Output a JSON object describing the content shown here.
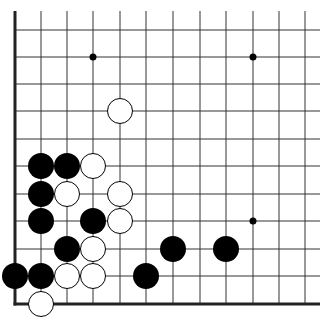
{
  "diagram": {
    "type": "go-board-fragment",
    "corner": "bottom-left",
    "columns_visible": 12,
    "rows_visible": 11,
    "colors": {
      "background": "#ffffff",
      "grid": "#333333",
      "edge": "#222222",
      "black_stone": "#000000",
      "white_stone": "#ffffff",
      "white_stone_outline": "#000000",
      "hoshi": "#000000"
    },
    "geometry": {
      "x_lines": [
        15,
        41,
        67,
        93,
        120,
        146,
        173,
        200,
        226,
        253,
        279,
        305
      ],
      "y_lines": [
        30,
        57,
        84,
        111,
        139,
        166,
        194,
        221,
        249,
        276,
        304
      ],
      "grid_top": 11,
      "grid_right": 320,
      "stone_radius": 13,
      "hoshi_radius": 3.5
    },
    "hoshi": [
      {
        "col": 3,
        "row": 1
      },
      {
        "col": 9,
        "row": 1
      },
      {
        "col": 9,
        "row": 7
      }
    ],
    "stones": {
      "black": [
        {
          "col": 1,
          "row": 5
        },
        {
          "col": 2,
          "row": 5
        },
        {
          "col": 1,
          "row": 6
        },
        {
          "col": 1,
          "row": 7
        },
        {
          "col": 3,
          "row": 7
        },
        {
          "col": 2,
          "row": 8
        },
        {
          "col": 6,
          "row": 8
        },
        {
          "col": 8,
          "row": 8
        },
        {
          "col": 0,
          "row": 9
        },
        {
          "col": 1,
          "row": 9
        },
        {
          "col": 5,
          "row": 9
        }
      ],
      "white": [
        {
          "col": 4,
          "row": 3
        },
        {
          "col": 3,
          "row": 5
        },
        {
          "col": 2,
          "row": 6
        },
        {
          "col": 4,
          "row": 6
        },
        {
          "col": 4,
          "row": 7
        },
        {
          "col": 3,
          "row": 8
        },
        {
          "col": 2,
          "row": 9
        },
        {
          "col": 3,
          "row": 9
        },
        {
          "col": 1,
          "row": 10
        }
      ]
    }
  }
}
